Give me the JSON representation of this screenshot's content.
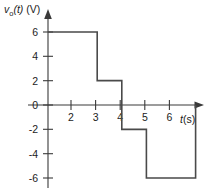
{
  "chart_data": {
    "type": "line",
    "title": "",
    "subtitle": "",
    "xlabel": "t(s)",
    "ylabel": "v_o(t) (V)",
    "ylabel_parts": {
      "symbol": "v",
      "subscript": "o",
      "argument": "(t)",
      "unit": "(V)"
    },
    "xlabel_parts": {
      "symbol": "t",
      "unit": "(s)"
    },
    "grid": false,
    "legend": null,
    "xlim": [
      0,
      7
    ],
    "ylim": [
      -6,
      6
    ],
    "xticks": [
      2,
      3,
      4,
      5,
      6
    ],
    "xtick_labels": [
      "2",
      "3",
      "4",
      "5",
      "6"
    ],
    "yticks": [
      6,
      4,
      2,
      0,
      -2,
      -4,
      -6
    ],
    "ytick_labels": [
      "6",
      "4",
      "2",
      "0",
      "-2",
      "-4",
      "-6"
    ],
    "series": [
      {
        "name": "v_o(t)",
        "color": "#4a4a4a",
        "style": "step",
        "segments": [
          {
            "t_start": 0,
            "t_end": 2,
            "value": 6
          },
          {
            "t_start": 2,
            "t_end": 3,
            "value": 2
          },
          {
            "t_start": 3,
            "t_end": 4,
            "value": -2
          },
          {
            "t_start": 4,
            "t_end": 6,
            "value": -6
          },
          {
            "t_start": 6,
            "t_end": 6,
            "value": 0
          }
        ],
        "points": [
          {
            "t": 0,
            "v": 6
          },
          {
            "t": 2,
            "v": 6
          },
          {
            "t": 2,
            "v": 2
          },
          {
            "t": 3,
            "v": 2
          },
          {
            "t": 3,
            "v": -2
          },
          {
            "t": 4,
            "v": -2
          },
          {
            "t": 4,
            "v": -6
          },
          {
            "t": 6,
            "v": -6
          },
          {
            "t": 6,
            "v": 0
          }
        ]
      }
    ],
    "axis_colors": {
      "axis": "#3a3a3a",
      "curve": "#4a4a4a",
      "text": "#1c1c1c",
      "background": "#ffffff"
    }
  }
}
